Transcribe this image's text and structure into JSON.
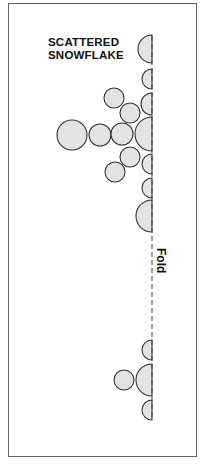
{
  "title": {
    "line1": "SCATTERED",
    "line2": "SNOWFLAKE"
  },
  "fold_label": "Fold",
  "colors": {
    "circle_fill": "#e3e3e3",
    "circle_stroke": "#333333",
    "frame": "#666666",
    "fold_line": "#444444"
  },
  "fold_x": 152,
  "circles": [
    {
      "cx": 152,
      "cy": 49,
      "r": 14,
      "half": true
    },
    {
      "cx": 152,
      "cy": 79,
      "r": 10,
      "half": true
    },
    {
      "cx": 152,
      "cy": 104,
      "r": 11,
      "half": true
    },
    {
      "cx": 114,
      "cy": 98,
      "r": 10,
      "half": false
    },
    {
      "cx": 130,
      "cy": 113,
      "r": 10,
      "half": false
    },
    {
      "cx": 72,
      "cy": 135,
      "r": 15,
      "half": false
    },
    {
      "cx": 100,
      "cy": 135,
      "r": 11,
      "half": false
    },
    {
      "cx": 122,
      "cy": 134,
      "r": 11,
      "half": false
    },
    {
      "cx": 152,
      "cy": 134,
      "r": 17,
      "half": true
    },
    {
      "cx": 130,
      "cy": 157,
      "r": 10,
      "half": false
    },
    {
      "cx": 115,
      "cy": 172,
      "r": 10,
      "half": false
    },
    {
      "cx": 152,
      "cy": 164,
      "r": 10,
      "half": true
    },
    {
      "cx": 152,
      "cy": 188,
      "r": 10,
      "half": true
    },
    {
      "cx": 152,
      "cy": 216,
      "r": 16,
      "half": true
    },
    {
      "cx": 152,
      "cy": 350,
      "r": 10,
      "half": true
    },
    {
      "cx": 124,
      "cy": 380,
      "r": 10,
      "half": false
    },
    {
      "cx": 152,
      "cy": 380,
      "r": 16,
      "half": true
    },
    {
      "cx": 152,
      "cy": 410,
      "r": 10,
      "half": true
    }
  ]
}
